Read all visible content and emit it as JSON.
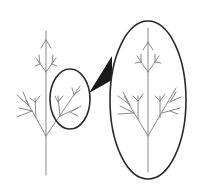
{
  "figure": {
    "type": "fractal-self-similarity-diagram",
    "colors": {
      "background": "#ffffff",
      "branch_stroke": "#7a7a7a",
      "outline_stroke": "#2a2a2a",
      "connector_fill": "#1a1a1a"
    },
    "elements": [
      {
        "name": "whole-tree",
        "label": ""
      },
      {
        "name": "highlight-circle",
        "label": ""
      },
      {
        "name": "magnify-connector",
        "label": ""
      },
      {
        "name": "magnified-ellipse",
        "label": ""
      },
      {
        "name": "magnified-branch",
        "label": ""
      }
    ]
  }
}
